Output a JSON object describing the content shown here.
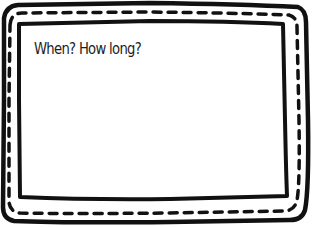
{
  "card": {
    "prompt": "When? How long?",
    "border_color": "#111111",
    "background": "#ffffff"
  }
}
